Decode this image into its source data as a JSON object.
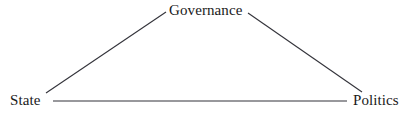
{
  "diagram": {
    "type": "triangle-relationship-diagram",
    "background_color": "#ffffff",
    "line_color": "#33333a",
    "text_color": "#1a1a1a",
    "nodes": [
      {
        "id": "governance",
        "label": "Governance",
        "position": "top-center"
      },
      {
        "id": "state",
        "label": "State",
        "position": "bottom-left"
      },
      {
        "id": "politics",
        "label": "Politics",
        "position": "bottom-right"
      }
    ],
    "edges": [
      {
        "id": "state-governance",
        "from": "State",
        "to": "Governance"
      },
      {
        "id": "governance-politics",
        "from": "Governance",
        "to": "Politics"
      },
      {
        "id": "state-politics",
        "from": "State",
        "to": "Politics"
      }
    ]
  }
}
